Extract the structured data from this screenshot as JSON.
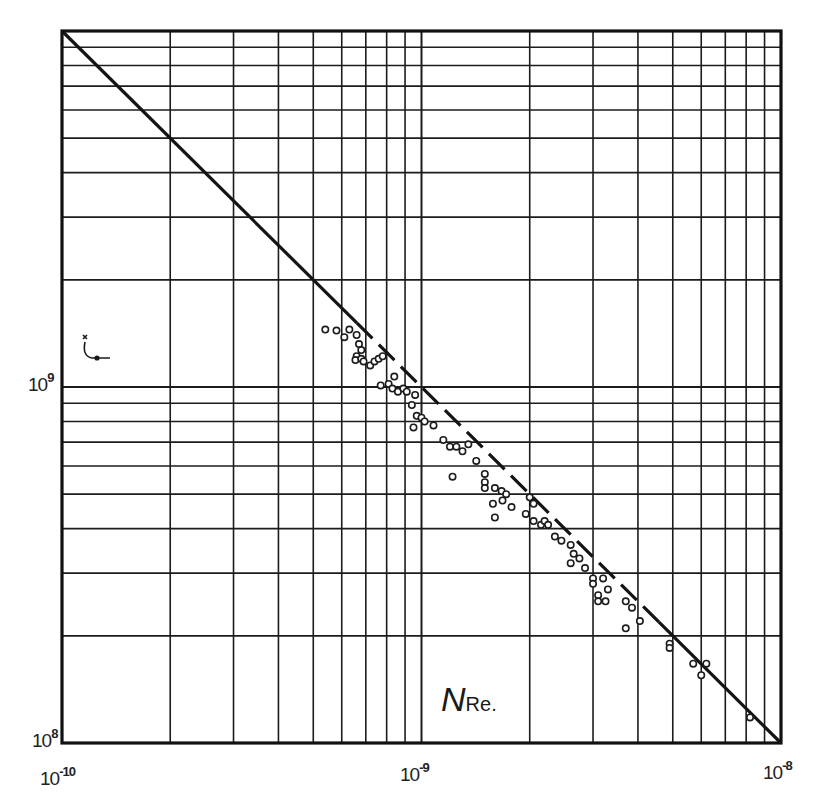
{
  "chart_data": {
    "type": "scatter",
    "title": "",
    "xlabel": "N_Re.",
    "xlabel_main": "N",
    "xlabel_sub": "Re.",
    "ylabel": "ζ*",
    "xscale": "log",
    "yscale": "log",
    "xlim": [
      1e-10,
      1e-08
    ],
    "ylim": [
      100000000.0,
      10000000000.0
    ],
    "grid": true,
    "legend": null,
    "x_tick_labels": [
      {
        "value": 1e-10,
        "base": "10",
        "exp": "-10"
      },
      {
        "value": 1e-09,
        "base": "10",
        "exp": "-9"
      },
      {
        "value": 1e-08,
        "base": "10",
        "exp": "-8"
      }
    ],
    "y_tick_labels": [
      {
        "value": 100000000.0,
        "base": "10",
        "exp": "8"
      },
      {
        "value": 1000000000.0,
        "base": "10",
        "exp": "9"
      }
    ],
    "series": [
      {
        "name": "theoretical line",
        "style": "solid/dashed line",
        "points": [
          [
            1e-10,
            10000000000.0
          ],
          [
            1e-08,
            100000000.0
          ]
        ]
      },
      {
        "name": "experimental data",
        "style": "open circles",
        "points": [
          [
            5.4e-10,
            1450000000.0
          ],
          [
            5.8e-10,
            1440000000.0
          ],
          [
            6.1e-10,
            1380000000.0
          ],
          [
            6.3e-10,
            1450000000.0
          ],
          [
            6.6e-10,
            1400000000.0
          ],
          [
            6.7e-10,
            1320000000.0
          ],
          [
            6.8e-10,
            1270000000.0
          ],
          [
            6.6e-10,
            1220000000.0
          ],
          [
            6.55e-10,
            1190000000.0
          ],
          [
            6.8e-10,
            1200000000.0
          ],
          [
            6.9e-10,
            1180000000.0
          ],
          [
            7.2e-10,
            1150000000.0
          ],
          [
            7.4e-10,
            1180000000.0
          ],
          [
            7.6e-10,
            1200000000.0
          ],
          [
            7.8e-10,
            1220000000.0
          ],
          [
            8.4e-10,
            1070000000.0
          ],
          [
            7.7e-10,
            1010000000.0
          ],
          [
            8.1e-10,
            1020000000.0
          ],
          [
            8.3e-10,
            990000000.0
          ],
          [
            8.6e-10,
            970000000.0
          ],
          [
            8.9e-10,
            990000000.0
          ],
          [
            9.1e-10,
            970000000.0
          ],
          [
            9.6e-10,
            950000000.0
          ],
          [
            9.4e-10,
            890000000.0
          ],
          [
            9.7e-10,
            830000000.0
          ],
          [
            1e-09,
            820000000.0
          ],
          [
            9.5e-10,
            770000000.0
          ],
          [
            1.02e-09,
            800000000.0
          ],
          [
            1.08e-09,
            780000000.0
          ],
          [
            1.15e-09,
            710000000.0
          ],
          [
            1.2e-09,
            680000000.0
          ],
          [
            1.25e-09,
            680000000.0
          ],
          [
            1.3e-09,
            660000000.0
          ],
          [
            1.35e-09,
            690000000.0
          ],
          [
            1.22e-09,
            560000000.0
          ],
          [
            1.42e-09,
            620000000.0
          ],
          [
            1.5e-09,
            570000000.0
          ],
          [
            1.5e-09,
            540000000.0
          ],
          [
            1.5e-09,
            520000000.0
          ],
          [
            1.6e-09,
            520000000.0
          ],
          [
            1.67e-09,
            510000000.0
          ],
          [
            1.72e-09,
            500000000.0
          ],
          [
            1.68e-09,
            480000000.0
          ],
          [
            1.58e-09,
            470000000.0
          ],
          [
            1.6e-09,
            430000000.0
          ],
          [
            1.78e-09,
            460000000.0
          ],
          [
            2e-09,
            490000000.0
          ],
          [
            2.05e-09,
            470000000.0
          ],
          [
            1.95e-09,
            440000000.0
          ],
          [
            2.05e-09,
            420000000.0
          ],
          [
            2.15e-09,
            410000000.0
          ],
          [
            2.2e-09,
            420000000.0
          ],
          [
            2.25e-09,
            410000000.0
          ],
          [
            2.35e-09,
            380000000.0
          ],
          [
            2.45e-09,
            370000000.0
          ],
          [
            2.6e-09,
            360000000.0
          ],
          [
            2.65e-09,
            340000000.0
          ],
          [
            2.75e-09,
            330000000.0
          ],
          [
            2.6e-09,
            320000000.0
          ],
          [
            2.85e-09,
            310000000.0
          ],
          [
            3e-09,
            290000000.0
          ],
          [
            3e-09,
            280000000.0
          ],
          [
            3.2e-09,
            290000000.0
          ],
          [
            3.3e-09,
            270000000.0
          ],
          [
            3.1e-09,
            260000000.0
          ],
          [
            3.1e-09,
            250000000.0
          ],
          [
            3.25e-09,
            250000000.0
          ],
          [
            3.7e-09,
            250000000.0
          ],
          [
            3.85e-09,
            240000000.0
          ],
          [
            3.7e-09,
            210000000.0
          ],
          [
            4.05e-09,
            220000000.0
          ],
          [
            4.9e-09,
            190000000.0
          ],
          [
            4.9e-09,
            185000000.0
          ],
          [
            5.7e-09,
            167000000.0
          ],
          [
            6.2e-09,
            167000000.0
          ],
          [
            6e-09,
            155000000.0
          ],
          [
            8.2e-09,
            118000000.0
          ]
        ]
      }
    ]
  }
}
